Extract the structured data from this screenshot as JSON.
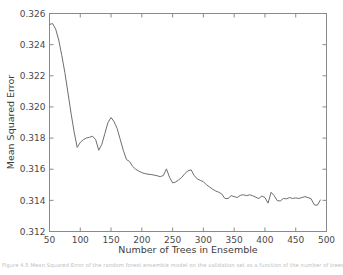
{
  "figure": {
    "background_color": "#ffffff",
    "line_color": "#6e6e6e",
    "axis_color": "#8a8a8a",
    "text_color": "#3c3c3c"
  },
  "caption": {
    "partial_text": "Figure 4.5 Mean Squared Error of the random forest ensemble model on the validation set as a function of the number of trees"
  },
  "chart_data": {
    "type": "line",
    "title": "",
    "xlabel": "Number of Trees in Ensemble",
    "ylabel": "Mean Squared Error",
    "xlim": [
      50,
      500
    ],
    "ylim": [
      0.312,
      0.326
    ],
    "xticks": [
      50,
      100,
      150,
      200,
      250,
      300,
      350,
      400,
      450,
      500
    ],
    "xtick_labels": [
      "50",
      "100",
      "150",
      "200",
      "250",
      "300",
      "350",
      "400",
      "450",
      "500"
    ],
    "yticks": [
      0.312,
      0.314,
      0.316,
      0.318,
      0.32,
      0.322,
      0.324,
      0.326
    ],
    "ytick_labels": [
      "0.312",
      "0.314",
      "0.316",
      "0.318",
      "0.320",
      "0.322",
      "0.324",
      "0.326"
    ],
    "grid": false,
    "legend": null,
    "series": [
      {
        "name": "Mean Squared Error",
        "color": "#6e6e6e",
        "x": [
          50,
          55,
          60,
          65,
          70,
          75,
          80,
          85,
          90,
          95,
          100,
          105,
          110,
          115,
          120,
          125,
          130,
          135,
          140,
          145,
          150,
          155,
          160,
          165,
          170,
          175,
          180,
          185,
          190,
          195,
          200,
          205,
          210,
          215,
          220,
          225,
          230,
          235,
          240,
          245,
          250,
          255,
          260,
          265,
          270,
          275,
          280,
          285,
          290,
          295,
          300,
          305,
          310,
          315,
          320,
          325,
          330,
          335,
          340,
          345,
          350,
          355,
          360,
          365,
          370,
          375,
          380,
          385,
          390,
          395,
          400,
          405,
          410,
          415,
          420,
          425,
          430,
          435,
          440,
          445,
          450,
          455,
          460,
          465,
          470,
          475,
          480,
          485,
          490
        ],
        "y": [
          0.3253,
          0.32535,
          0.325,
          0.3243,
          0.3233,
          0.3222,
          0.3209,
          0.3196,
          0.3184,
          0.3174,
          0.31772,
          0.3179,
          0.318,
          0.31805,
          0.31812,
          0.3179,
          0.31722,
          0.3176,
          0.3183,
          0.319,
          0.31932,
          0.31905,
          0.3186,
          0.3179,
          0.3172,
          0.31662,
          0.3165,
          0.31618,
          0.316,
          0.31588,
          0.31578,
          0.31572,
          0.31568,
          0.31566,
          0.31562,
          0.31558,
          0.31552,
          0.3156,
          0.31602,
          0.31548,
          0.31512,
          0.31518,
          0.31532,
          0.31548,
          0.31572,
          0.3159,
          0.31596,
          0.3156,
          0.31538,
          0.31528,
          0.3152,
          0.315,
          0.31486,
          0.31472,
          0.3146,
          0.31452,
          0.3144,
          0.31412,
          0.31412,
          0.3143,
          0.31424,
          0.31418,
          0.31432,
          0.31436,
          0.3143,
          0.31436,
          0.3143,
          0.3142,
          0.31412,
          0.31428,
          0.31418,
          0.31382,
          0.31452,
          0.3143,
          0.31398,
          0.31396,
          0.31412,
          0.3141,
          0.31418,
          0.31412,
          0.31416,
          0.31412,
          0.31418,
          0.31424,
          0.31418,
          0.3141,
          0.31372,
          0.31368,
          0.31402
        ]
      }
    ]
  }
}
